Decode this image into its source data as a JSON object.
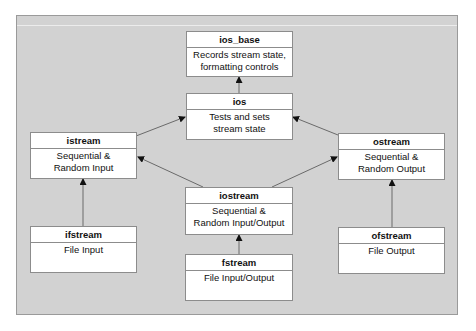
{
  "diagram": {
    "type": "class-hierarchy",
    "colors": {
      "panel_bg": "#d2d2d2",
      "box_bg": "#ffffff",
      "border": "#8c8c8c",
      "arrow": "#6a6a6a"
    },
    "nodes": {
      "ios_base": {
        "title": "ios_base",
        "desc_line1": "Records stream state,",
        "desc_line2": "formatting controls"
      },
      "ios": {
        "title": "ios",
        "desc_line1": "Tests and sets",
        "desc_line2": "stream state"
      },
      "istream": {
        "title": "istream",
        "desc_line1": "Sequential &",
        "desc_line2": "Random Input"
      },
      "ostream": {
        "title": "ostream",
        "desc_line1": "Sequential &",
        "desc_line2": "Random Output"
      },
      "iostream": {
        "title": "iostream",
        "desc_line1": "Sequential &",
        "desc_line2": "Random Input/Output"
      },
      "ifstream": {
        "title": "ifstream",
        "desc_line1": "File Input",
        "desc_line2": ""
      },
      "ofstream": {
        "title": "ofstream",
        "desc_line1": "File Output",
        "desc_line2": ""
      },
      "fstream": {
        "title": "fstream",
        "desc_line1": "File Input/Output",
        "desc_line2": ""
      }
    },
    "edges": [
      {
        "from": "ios",
        "to": "ios_base"
      },
      {
        "from": "istream",
        "to": "ios"
      },
      {
        "from": "ostream",
        "to": "ios"
      },
      {
        "from": "iostream",
        "to": "istream"
      },
      {
        "from": "iostream",
        "to": "ostream"
      },
      {
        "from": "ifstream",
        "to": "istream"
      },
      {
        "from": "ofstream",
        "to": "ostream"
      },
      {
        "from": "fstream",
        "to": "iostream"
      }
    ]
  }
}
